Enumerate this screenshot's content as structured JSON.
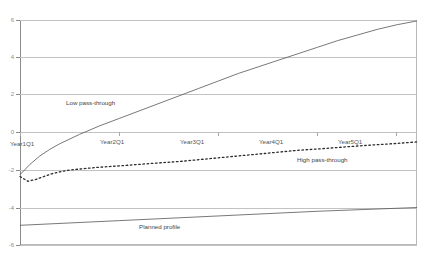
{
  "chart": {
    "title": "",
    "axis": {
      "ylabel": "",
      "xlabel": "",
      "ylim": [
        -6,
        6
      ],
      "yticks": [
        "6",
        "4",
        "2",
        "0",
        "-2",
        "-4",
        "-6"
      ],
      "xticks": [
        "Year1Q1",
        "Year2Q1",
        "Year3Q1",
        "Year4Q1",
        "Year5Q1"
      ]
    },
    "annotations": [
      {
        "text": "Low pass-through",
        "name": "annotation-low-pass-through"
      },
      {
        "text": "High pass-through",
        "name": "annotation-high-pass-through"
      },
      {
        "text": "Planned profile",
        "name": "annotation-planned-profile"
      }
    ],
    "colors": {
      "line": "#555555",
      "grid": "#c2c2c2",
      "frame": "#b9b9b9",
      "text": "#444444"
    }
  },
  "chart_data": {
    "type": "line",
    "title": "",
    "xlabel": "",
    "ylabel": "",
    "ylim": [
      -6,
      6
    ],
    "xlim": [
      0,
      20
    ],
    "grid": true,
    "legend": "annotations-inline",
    "xtick_labels": [
      "Year1Q1",
      "Year2Q1",
      "Year3Q1",
      "Year4Q1",
      "Year5Q1"
    ],
    "xtick_positions": [
      0,
      4,
      8,
      12,
      16
    ],
    "ytick_labels": [
      "6",
      "4",
      "2",
      "0",
      "-2",
      "-4",
      "-6"
    ],
    "ytick_values": [
      6,
      4,
      2,
      0,
      -2,
      -4,
      -6
    ],
    "series": [
      {
        "name": "Low pass-through",
        "style": "solid",
        "x": [
          0,
          0.5,
          1,
          1.5,
          2,
          3,
          4,
          5,
          6,
          7,
          8,
          9,
          10,
          11,
          12,
          13,
          14,
          15,
          16,
          17,
          18,
          19,
          20
        ],
        "values": [
          -2.25,
          -1.7,
          -1.25,
          -0.9,
          -0.6,
          -0.1,
          0.35,
          0.75,
          1.15,
          1.55,
          1.95,
          2.35,
          2.75,
          3.15,
          3.5,
          3.85,
          4.2,
          4.55,
          4.9,
          5.2,
          5.5,
          5.75,
          5.95
        ]
      },
      {
        "name": "High pass-through",
        "style": "dotted",
        "x": [
          0,
          0.4,
          0.8,
          1.2,
          1.6,
          2,
          2.5,
          3,
          4,
          5,
          6,
          7,
          8,
          9,
          10,
          11,
          12,
          13,
          14,
          15,
          16,
          17,
          18,
          19,
          20
        ],
        "values": [
          -2.35,
          -2.6,
          -2.5,
          -2.35,
          -2.2,
          -2.1,
          -2.0,
          -1.95,
          -1.85,
          -1.78,
          -1.7,
          -1.62,
          -1.55,
          -1.45,
          -1.35,
          -1.25,
          -1.15,
          -1.05,
          -0.95,
          -0.88,
          -0.8,
          -0.72,
          -0.65,
          -0.58,
          -0.5
        ]
      },
      {
        "name": "Planned profile",
        "style": "solid",
        "x": [
          0,
          5,
          10,
          15,
          20
        ],
        "values": [
          -4.95,
          -4.7,
          -4.45,
          -4.2,
          -4.0
        ]
      }
    ]
  }
}
